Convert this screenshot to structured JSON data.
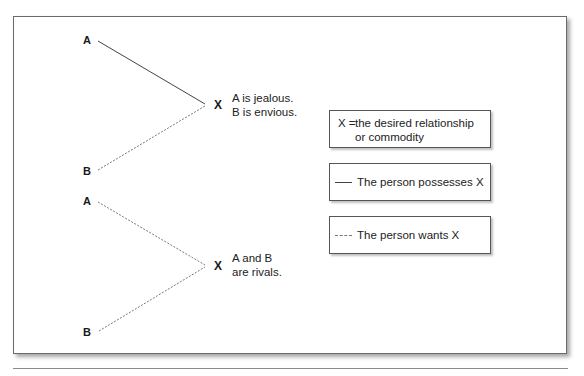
{
  "diagram": {
    "top": {
      "node_a": "A",
      "node_b": "B",
      "vertex": "X",
      "description": [
        "A is jealous.",
        "B is envious."
      ],
      "a_line_style": "solid",
      "b_line_style": "dashed"
    },
    "bottom": {
      "node_a": "A",
      "node_b": "B",
      "vertex": "X",
      "description": [
        "A and B",
        "are rivals."
      ],
      "a_line_style": "dashed",
      "b_line_style": "dashed"
    }
  },
  "legend": {
    "definition": {
      "key": "X =",
      "lines": [
        "the desired relationship",
        "or commodity"
      ]
    },
    "solid": {
      "line_style": "solid",
      "label": "The person possesses X"
    },
    "dashed": {
      "line_style": "dashed",
      "label": "The person wants X"
    }
  },
  "colors": {
    "border": "#555555",
    "solid_line": "#444444",
    "dashed_line": "#777777",
    "text": "#1a1a1a"
  }
}
